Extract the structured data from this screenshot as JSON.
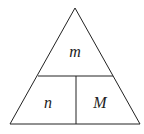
{
  "diagram": {
    "type": "formula-triangle",
    "top_label": "m",
    "bottom_left_label": "n",
    "bottom_right_label": "M",
    "stroke_color": "#222222",
    "background": "#ffffff"
  }
}
